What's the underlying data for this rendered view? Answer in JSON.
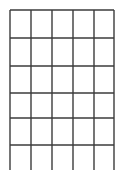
{
  "figure": {
    "kind": "empty-grid-table",
    "title": "",
    "background_color": "#ffffff",
    "line_color": "#3b3b3b",
    "line_width": 1.4,
    "width": 127,
    "height": 180
  },
  "grid": {
    "columns": 5,
    "rows": 6,
    "left": 10,
    "right": 114,
    "top": 10,
    "bottom": 145,
    "vertical_x": [
      10,
      31,
      52,
      73,
      94,
      114
    ],
    "horizontal_y": [
      10,
      38,
      66,
      93,
      118,
      145
    ],
    "vertical_overshoot_bottom_y": 170,
    "has_bottom_border": false,
    "has_top_border": true,
    "has_left_border": true,
    "has_right_border": true
  },
  "cells": {
    "row_labels": [
      "row-1",
      "row-2",
      "row-3",
      "row-4",
      "row-5",
      "row-6"
    ],
    "column_labels": [
      "col-1",
      "col-2",
      "col-3",
      "col-4",
      "col-5"
    ],
    "values": [
      [
        "",
        "",
        "",
        "",
        ""
      ],
      [
        "",
        "",
        "",
        "",
        ""
      ],
      [
        "",
        "",
        "",
        "",
        ""
      ],
      [
        "",
        "",
        "",
        "",
        ""
      ],
      [
        "",
        "",
        "",
        "",
        ""
      ],
      [
        "",
        "",
        "",
        "",
        ""
      ]
    ]
  }
}
